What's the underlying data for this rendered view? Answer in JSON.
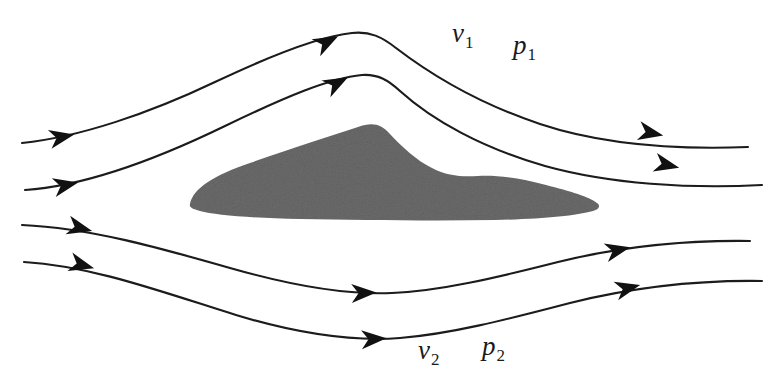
{
  "figure": {
    "background_color": "#ffffff",
    "line_color": "#1a1a1a",
    "body_fill_color": "#6b6b6b",
    "width": 784,
    "height": 383
  },
  "labels": {
    "velocity_top": {
      "symbol": "v",
      "subscript": "1",
      "text": "v",
      "sub": "1"
    },
    "pressure_top": {
      "symbol": "p",
      "subscript": "1",
      "text": "p",
      "sub": "1"
    },
    "velocity_bottom": {
      "symbol": "v",
      "subscript": "2",
      "text": "v",
      "sub": "2"
    },
    "pressure_bottom": {
      "symbol": "p",
      "subscript": "2",
      "text": "p",
      "sub": "2"
    }
  },
  "body": {
    "name": "airfoil-cross-section",
    "fill": "#6b6b6b",
    "path": "M 190 204 C 193 188 215 175 250 163 C 290 149 330 136 358 127 C 372 122 381 124 389 133 C 402 147 416 160 432 168 C 447 176 462 177 478 176 C 497 175 520 178 546 185 C 570 191 590 197 597 203 C 601 206 599 209 593 211 C 575 216 540 219 495 220 C 430 221 360 220 300 219 C 250 218 215 215 200 211 C 192 209 189 207 190 204 Z"
  },
  "streamlines": [
    {
      "name": "streamline-top-outer",
      "path": "M 22 143 C 80 137 150 113 215 82 C 270 56 320 36 352 33 C 370 31 382 37 396 48 C 430 74 480 104 540 124 C 600 144 670 150 748 147",
      "arrows": [
        {
          "x": 62,
          "y": 137,
          "angle": -11
        },
        {
          "x": 327,
          "y": 42,
          "angle": -27
        },
        {
          "x": 651,
          "y": 133,
          "angle": 11
        }
      ]
    },
    {
      "name": "streamline-top-inner",
      "path": "M 25 190 C 85 186 155 160 225 126 C 285 97 330 78 362 75 C 378 74 388 80 400 91 C 432 120 482 148 545 166 C 610 184 690 189 762 185",
      "arrows": [
        {
          "x": 66,
          "y": 185,
          "angle": -12
        },
        {
          "x": 337,
          "y": 83,
          "angle": -28
        },
        {
          "x": 667,
          "y": 165,
          "angle": 13
        }
      ]
    },
    {
      "name": "streamline-bottom-inner",
      "path": "M 22 225 C 90 228 160 248 230 268 C 300 288 350 295 392 293 C 440 291 495 278 558 262 C 615 248 680 240 750 241",
      "arrows": [
        {
          "x": 80,
          "y": 228,
          "angle": 14
        },
        {
          "x": 364,
          "y": 293,
          "angle": -2
        },
        {
          "x": 618,
          "y": 250,
          "angle": -13
        }
      ]
    },
    {
      "name": "streamline-bottom-outer",
      "path": "M 24 262 C 92 266 162 292 236 315 C 305 336 360 341 400 338 C 450 334 505 320 570 303 C 630 288 695 280 762 281",
      "arrows": [
        {
          "x": 82,
          "y": 265,
          "angle": 15
        },
        {
          "x": 374,
          "y": 339,
          "angle": -3
        },
        {
          "x": 628,
          "y": 288,
          "angle": -14
        }
      ]
    }
  ]
}
